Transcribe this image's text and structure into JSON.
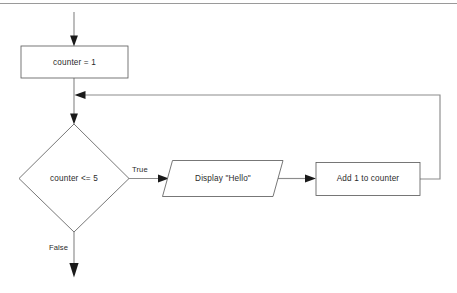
{
  "diagram": {
    "colors": {
      "background": "#ffffff",
      "shape_stroke": "#5f5f5f",
      "shape_fill": "#ffffff",
      "connector": "#8c8c8c",
      "arrowhead": "#1a1a1a",
      "text": "#2b2b2b",
      "top_rule": "#9a9a9a"
    },
    "nodes": [
      {
        "id": "init",
        "shape": "rectangle",
        "label": "counter = 1"
      },
      {
        "id": "decision",
        "shape": "diamond",
        "label": "counter <= 5"
      },
      {
        "id": "display",
        "shape": "parallelogram",
        "label": "Display \"Hello\""
      },
      {
        "id": "increment",
        "shape": "rectangle",
        "label": "Add 1 to counter"
      }
    ],
    "edge_labels": {
      "true": "True",
      "false": "False"
    }
  }
}
